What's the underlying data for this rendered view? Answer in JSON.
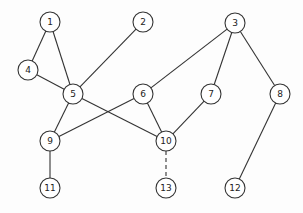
{
  "diagram": {
    "type": "graph",
    "node_radius": 10,
    "stroke_color": "#333333",
    "fill_color": "#ffffff",
    "nodes": [
      {
        "id": "1",
        "label": "1",
        "x": 50,
        "y": 22
      },
      {
        "id": "2",
        "label": "2",
        "x": 143,
        "y": 22
      },
      {
        "id": "3",
        "label": "3",
        "x": 235,
        "y": 23
      },
      {
        "id": "4",
        "label": "4",
        "x": 28,
        "y": 70
      },
      {
        "id": "5",
        "label": "5",
        "x": 73,
        "y": 94
      },
      {
        "id": "6",
        "label": "6",
        "x": 143,
        "y": 94
      },
      {
        "id": "7",
        "label": "7",
        "x": 211,
        "y": 94
      },
      {
        "id": "8",
        "label": "8",
        "x": 280,
        "y": 94
      },
      {
        "id": "9",
        "label": "9",
        "x": 50,
        "y": 141
      },
      {
        "id": "10",
        "label": "10",
        "x": 166,
        "y": 141
      },
      {
        "id": "11",
        "label": "11",
        "x": 50,
        "y": 188
      },
      {
        "id": "12",
        "label": "12",
        "x": 235,
        "y": 188
      },
      {
        "id": "13",
        "label": "13",
        "x": 166,
        "y": 188
      }
    ],
    "edges": [
      {
        "from": "1",
        "to": "4",
        "style": "solid"
      },
      {
        "from": "1",
        "to": "5",
        "style": "solid"
      },
      {
        "from": "4",
        "to": "5",
        "style": "solid"
      },
      {
        "from": "2",
        "to": "5",
        "style": "solid"
      },
      {
        "from": "5",
        "to": "9",
        "style": "solid"
      },
      {
        "from": "5",
        "to": "10",
        "style": "solid"
      },
      {
        "from": "6",
        "to": "9",
        "style": "solid"
      },
      {
        "from": "6",
        "to": "10",
        "style": "solid"
      },
      {
        "from": "3",
        "to": "6",
        "style": "solid"
      },
      {
        "from": "3",
        "to": "7",
        "style": "solid"
      },
      {
        "from": "3",
        "to": "8",
        "style": "solid"
      },
      {
        "from": "7",
        "to": "10",
        "style": "solid"
      },
      {
        "from": "8",
        "to": "12",
        "style": "solid"
      },
      {
        "from": "9",
        "to": "11",
        "style": "solid"
      },
      {
        "from": "10",
        "to": "13",
        "style": "dashed"
      }
    ]
  }
}
